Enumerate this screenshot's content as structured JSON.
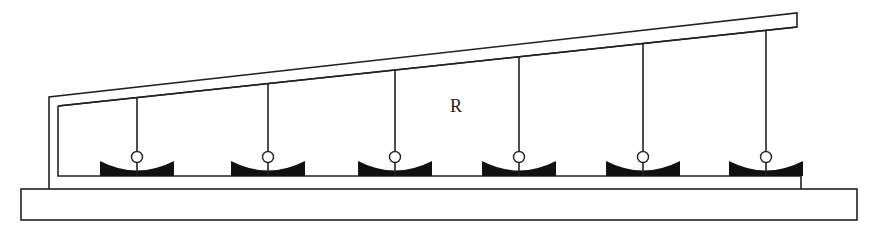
{
  "diagram": {
    "type": "solar-collector-greenhouse-cross-section",
    "region_label": "R",
    "collector_count": 6,
    "components": {
      "base": "ground base slab",
      "frame": "sloped roof enclosure",
      "collectors": "parabolic trough reflectors with absorber tubes suspended from roof"
    }
  }
}
